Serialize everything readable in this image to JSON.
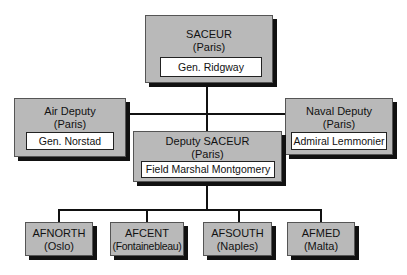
{
  "chart": {
    "top": {
      "title": "SACEUR",
      "location": "(Paris)",
      "holder": "Gen. Ridgway"
    },
    "air_deputy": {
      "title": "Air Deputy",
      "location": "(Paris)",
      "holder": "Gen. Norstad"
    },
    "naval_deputy": {
      "title": "Naval Deputy",
      "location": "(Paris)",
      "holder": "Admiral Lemmonier"
    },
    "deputy_saceur": {
      "title": "Deputy SACEUR",
      "location": "(Paris)",
      "holder": "Field Marshal Montgomery"
    },
    "commands": [
      {
        "title": "AFNORTH",
        "location": "(Oslo)"
      },
      {
        "title": "AFCENT",
        "location": "(Fontainebleau)"
      },
      {
        "title": "AFSOUTH",
        "location": "(Naples)"
      },
      {
        "title": "AFMED",
        "location": "(Malta)"
      }
    ]
  }
}
